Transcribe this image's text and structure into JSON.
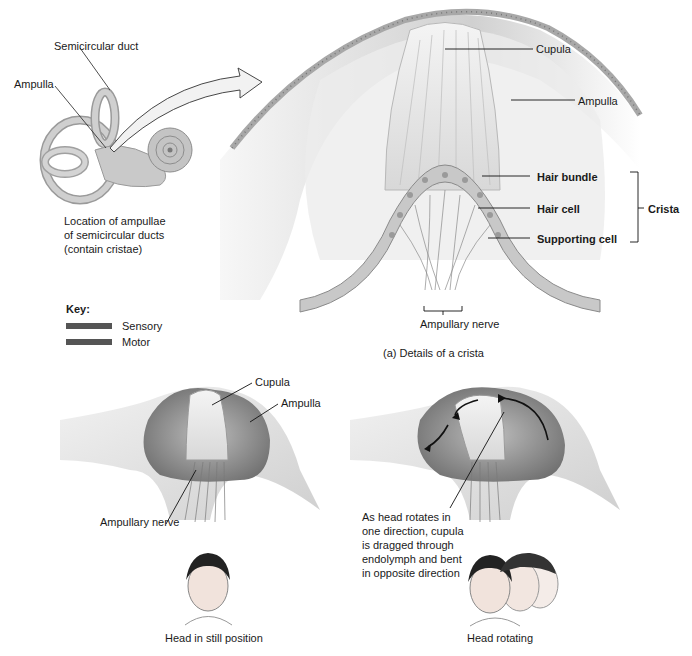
{
  "figure": {
    "ear_inset": {
      "labels": {
        "semicircular_duct": "Semicircular duct",
        "ampulla": "Ampulla"
      },
      "caption": [
        "Location of ampullae",
        "of semicircular ducts",
        "(contain cristae)"
      ]
    },
    "crista_detail": {
      "labels": {
        "cupula": "Cupula",
        "ampulla": "Ampulla",
        "hair_bundle": "Hair bundle",
        "hair_cell": "Hair cell",
        "supporting_cell": "Supporting cell",
        "crista": "Crista",
        "ampullary_nerve": "Ampullary nerve"
      },
      "caption": "(a) Details of a crista"
    },
    "key": {
      "title": "Key:",
      "items": [
        {
          "label": "Sensory",
          "color": "#5a5a5a"
        },
        {
          "label": "Motor",
          "color": "#5a5a5a"
        }
      ]
    },
    "still_panel": {
      "labels": {
        "cupula": "Cupula",
        "ampulla": "Ampulla",
        "ampullary_nerve": "Ampullary nerve"
      },
      "caption": "Head in still position"
    },
    "rotating_panel": {
      "annotation": [
        "As head rotates in",
        "one direction, cupula",
        "is dragged through",
        "endolymph and bent",
        "in opposite direction"
      ],
      "caption": "Head rotating"
    }
  }
}
